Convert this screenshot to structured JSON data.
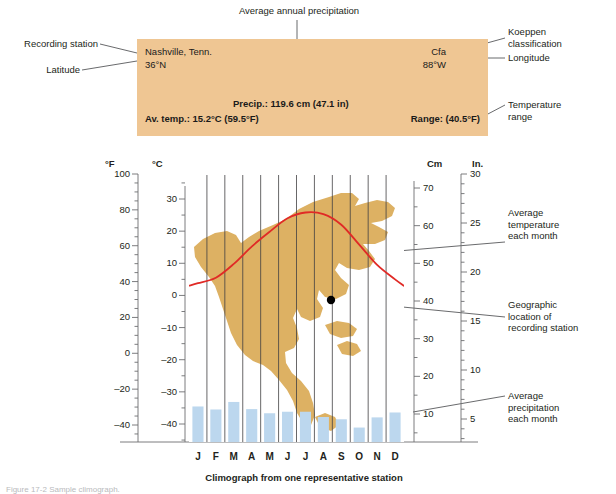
{
  "figure": {
    "chart_caption": "Climograph from one representative station",
    "figure_caption": "Figure 17-2   Sample climograph."
  },
  "info_box": {
    "background_color": "#efc693",
    "station_name": "Nashville, Tenn.",
    "latitude": "36°N",
    "koeppen": "Cfa",
    "longitude": "88°W",
    "precip": "Precip.: 119.6 cm (47.1 in)",
    "avg_temp": "Av. temp.: 15.2°C (59.5°F)",
    "range": "Range: (40.5°F)"
  },
  "callouts": {
    "recording_station": "Recording station",
    "latitude": "Latitude",
    "avg_annual_precip": "Average annual precipitation",
    "koeppen_classification": "Koeppen\nclassification",
    "longitude": "Longitude",
    "temperature_range": "Temperature\nrange",
    "avg_temp_each_month": "Average\ntemperature\neach month",
    "geographic_location": "Geographic\nlocation of\nrecording station",
    "avg_precip_each_month": "Average\nprecipitation\neach month"
  },
  "chart_data": {
    "type": "bar",
    "title": "Climograph from one representative station",
    "categories": [
      "J",
      "F",
      "M",
      "A",
      "M",
      "J",
      "J",
      "A",
      "S",
      "O",
      "N",
      "D"
    ],
    "series": [
      {
        "name": "Average precipitation each month",
        "type": "bar",
        "unit": "cm",
        "color": "#bcd7ee",
        "values": [
          12.0,
          11.2,
          13.2,
          11.3,
          10.2,
          10.6,
          10.6,
          9.2,
          8.6,
          6.4,
          9.1,
          10.4
        ]
      },
      {
        "name": "Average temperature each month",
        "type": "line",
        "unit": "°C",
        "color": "#e02a26",
        "values": [
          3.8,
          5.5,
          9.8,
          15.2,
          19.8,
          24.0,
          25.8,
          25.3,
          22.0,
          15.8,
          9.5,
          5.0
        ]
      }
    ],
    "axes": {
      "left_outer": {
        "title": "°F",
        "unit": "°F",
        "ticks": [
          100,
          80,
          60,
          40,
          20,
          0,
          -20,
          -40
        ],
        "minor_step": 5,
        "range": [
          -55,
          100
        ]
      },
      "left_inner": {
        "title": "°C",
        "unit": "°C",
        "ticks": [
          30,
          20,
          10,
          0,
          -10,
          -20,
          -30,
          -40
        ],
        "minor_step": 5,
        "range": [
          -48,
          35
        ]
      },
      "right_inner": {
        "title": "Cm",
        "unit": "cm",
        "ticks": [
          70,
          60,
          50,
          40,
          30,
          20,
          10
        ],
        "minor_step": 5,
        "range": [
          0,
          76
        ]
      },
      "right_outer": {
        "title": "In.",
        "unit": "in",
        "ticks": [
          30,
          25,
          20,
          15,
          10,
          5
        ],
        "minor_step": 1,
        "range": [
          0,
          30
        ]
      }
    },
    "grid": "vertical only, one line per month boundary",
    "legend": "annotated with leader lines, no legend box",
    "map_inset": {
      "name": "north-america-map",
      "color": "#ddb163",
      "marker": "black dot at recording station (Nashville)"
    }
  }
}
